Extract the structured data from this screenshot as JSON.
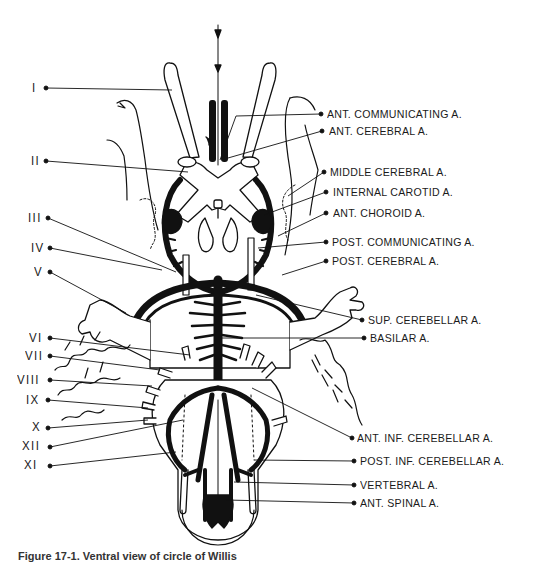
{
  "figure": {
    "caption": "Figure 17-1. Ventral view of circle of Willis"
  },
  "left_labels": [
    {
      "id": "I",
      "text": "I",
      "x": 32,
      "y": 82
    },
    {
      "id": "II",
      "text": "II",
      "x": 31,
      "y": 155
    },
    {
      "id": "III",
      "text": "III",
      "x": 28,
      "y": 212
    },
    {
      "id": "IV",
      "text": "IV",
      "x": 31,
      "y": 242
    },
    {
      "id": "V",
      "text": "V",
      "x": 34,
      "y": 266
    },
    {
      "id": "VI",
      "text": "VI",
      "x": 29,
      "y": 332
    },
    {
      "id": "VII",
      "text": "VII",
      "x": 25,
      "y": 350
    },
    {
      "id": "VIII",
      "text": "VIII",
      "x": 17,
      "y": 374
    },
    {
      "id": "IX",
      "text": "IX",
      "x": 26,
      "y": 394
    },
    {
      "id": "X",
      "text": "X",
      "x": 32,
      "y": 421
    },
    {
      "id": "XII",
      "text": "XII",
      "x": 22,
      "y": 440
    },
    {
      "id": "XI",
      "text": "XI",
      "x": 24,
      "y": 459
    }
  ],
  "right_labels": [
    {
      "id": "ant-communicating",
      "text": "ANT.  COMMUNICATING  A.",
      "x": 327,
      "y": 108
    },
    {
      "id": "ant-cerebral",
      "text": "ANT.  CEREBRAL A.",
      "x": 329,
      "y": 127
    },
    {
      "id": "middle-cerebral",
      "text": "MIDDLE  CEREBRAL  A.",
      "x": 330,
      "y": 167
    },
    {
      "id": "internal-carotid",
      "text": "INTERNAL  CAROTID A.",
      "x": 333,
      "y": 187
    },
    {
      "id": "ant-choroid",
      "text": "ANT.  CHOROID  A.",
      "x": 333,
      "y": 208
    },
    {
      "id": "post-communicating",
      "text": "POST.  COMMUNICATING A.",
      "x": 332,
      "y": 236
    },
    {
      "id": "post-cerebral",
      "text": "POST.  CEREBRAL A.",
      "x": 332,
      "y": 256
    },
    {
      "id": "sup-cerebellar",
      "text": "SUP.  CEREBELLAR  A.",
      "x": 368,
      "y": 314
    },
    {
      "id": "basilar",
      "text": "BASILAR  A.",
      "x": 370,
      "y": 333
    },
    {
      "id": "ant-inf-cerebellar",
      "text": "ANT.  INF.  CEREBELLAR  A.",
      "x": 357,
      "y": 432
    },
    {
      "id": "post-inf-cerebellar",
      "text": "POST.  INF.  CEREBELLAR  A.",
      "x": 360,
      "y": 456
    },
    {
      "id": "vertebral",
      "text": "VERTEBRAL  A.",
      "x": 360,
      "y": 480
    },
    {
      "id": "ant-spinal",
      "text": "ANT.  SPINAL A.",
      "x": 360,
      "y": 498
    }
  ],
  "colors": {
    "ink": "#111111",
    "paper": "#ffffff"
  }
}
